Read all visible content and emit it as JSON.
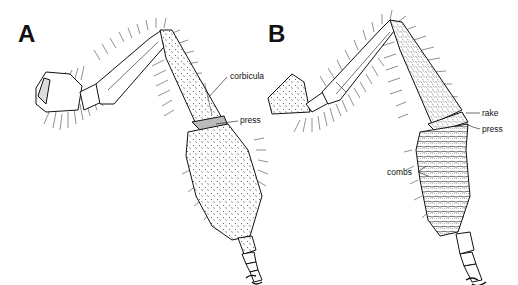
{
  "figure": {
    "panels": [
      {
        "letter": "A",
        "labels": {
          "corbicula": "corbicula",
          "press": "press"
        }
      },
      {
        "letter": "B",
        "labels": {
          "rake": "rake",
          "press": "press",
          "combs": "combs"
        }
      }
    ],
    "colors": {
      "ink": "#111111",
      "background": "#ffffff"
    }
  }
}
